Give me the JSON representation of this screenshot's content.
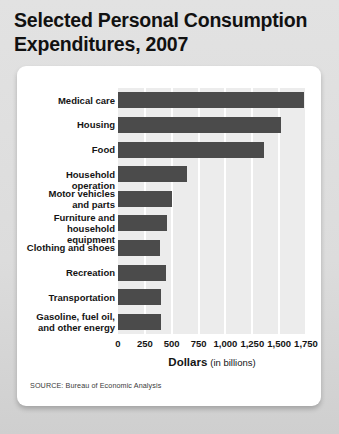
{
  "title": "Selected Personal Consumption Expenditures, 2007",
  "source_note": "SOURCE: Bureau of Economic Analysis",
  "axis": {
    "x_title_strong": "Dollars",
    "x_title_sub": "(in billions)"
  },
  "colors": {
    "bar": "#4b4b4b",
    "plot_background": "#ececec",
    "gridline": "#ffffff",
    "card_background": "#ffffff",
    "page_background": "#dcdcdc",
    "text": "#141414"
  },
  "chart_data": {
    "type": "bar",
    "orientation": "horizontal",
    "title": "Selected Personal Consumption Expenditures, 2007",
    "xlabel": "Dollars (in billions)",
    "ylabel": "",
    "xlim": [
      0,
      1750
    ],
    "xticks": [
      0,
      250,
      500,
      750,
      1000,
      1250,
      1500,
      1750
    ],
    "xticklabels": [
      "0",
      "250",
      "500",
      "750",
      "1,000",
      "1,250",
      "1,500",
      "1,750"
    ],
    "grid": true,
    "legend": false,
    "categories": [
      "Medical care",
      "Housing",
      "Food",
      "Household operation",
      "Motor vehicles and parts",
      "Furniture and household equipment",
      "Clothing and shoes",
      "Recreation",
      "Transportation",
      "Gasoline, fuel oil, and other energy"
    ],
    "category_label_lines": [
      [
        "Medical care"
      ],
      [
        "Housing"
      ],
      [
        "Food"
      ],
      [
        "Household operation"
      ],
      [
        "Motor vehicles",
        "and parts"
      ],
      [
        "Furniture and",
        "household equipment"
      ],
      [
        "Clothing and shoes"
      ],
      [
        "Recreation"
      ],
      [
        "Transportation"
      ],
      [
        "Gasoline, fuel oil,",
        "and other energy"
      ]
    ],
    "values": [
      1730,
      1520,
      1360,
      640,
      500,
      460,
      390,
      450,
      400,
      400
    ],
    "units": "billions of dollars"
  }
}
